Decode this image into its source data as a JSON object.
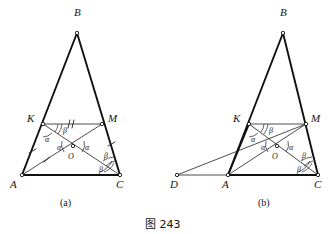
{
  "figure": {
    "caption": "图 243",
    "panels": [
      {
        "id": "a",
        "caption": "(a)",
        "vertex_labels": [
          "B",
          "K",
          "M",
          "A",
          "C",
          "O"
        ],
        "angle_labels": [
          "α",
          "β",
          "α",
          "α",
          "α",
          "β",
          "β"
        ],
        "points": {
          "B": {
            "x": 77,
            "y": 33,
            "label": "B",
            "label_x": 74,
            "label_y": 16
          },
          "K": {
            "x": 43,
            "y": 124,
            "label": "K",
            "label_x": 27,
            "label_y": 122
          },
          "M": {
            "x": 102,
            "y": 124,
            "label": "M",
            "label_x": 108,
            "label_y": 122
          },
          "A": {
            "x": 22,
            "y": 175,
            "label": "A",
            "label_x": 10,
            "label_y": 188
          },
          "C": {
            "x": 120,
            "y": 175,
            "label": "C",
            "label_x": 118,
            "label_y": 188
          },
          "O": {
            "x": 73,
            "y": 146,
            "label": "O",
            "label_x": 68,
            "label_y": 158
          }
        },
        "angles": {
          "alpha_KAO": {
            "text": "α",
            "x": 47,
            "y": 141
          },
          "alpha_AOK": {
            "text": "α",
            "x": 61,
            "y": 147
          },
          "alpha_MOC": {
            "text": "α",
            "x": 86,
            "y": 147
          },
          "beta_KMO": {
            "text": "β",
            "x": 65,
            "y": 130
          },
          "beta_MCO": {
            "text": "β",
            "x": 105,
            "y": 155
          },
          "beta_OCA": {
            "text": "β",
            "x": 101,
            "y": 170
          }
        }
      },
      {
        "id": "b",
        "caption": "(b)",
        "vertex_labels": [
          "B",
          "K",
          "M",
          "D",
          "A",
          "C",
          "O"
        ],
        "angle_labels": [
          "α",
          "β",
          "α",
          "α",
          "β",
          "β"
        ],
        "points": {
          "B": {
            "x": 283,
            "y": 33,
            "label": "B",
            "label_x": 280,
            "label_y": 16
          },
          "K": {
            "x": 249,
            "y": 124,
            "label": "K",
            "label_x": 233,
            "label_y": 122
          },
          "M": {
            "x": 306,
            "y": 124,
            "label": "M",
            "label_x": 312,
            "label_y": 122
          },
          "D": {
            "x": 177,
            "y": 175,
            "label": "D",
            "label_x": 172,
            "label_y": 188
          },
          "A": {
            "x": 228,
            "y": 175,
            "label": "A",
            "label_x": 224,
            "label_y": 188
          },
          "C": {
            "x": 318,
            "y": 175,
            "label": "C",
            "label_x": 316,
            "label_y": 188
          },
          "O": {
            "x": 277,
            "y": 146,
            "label": "O",
            "label_x": 274,
            "label_y": 158
          }
        },
        "angles": {
          "alpha_KAO": {
            "text": "α",
            "x": 252,
            "y": 141
          },
          "alpha_AOK": {
            "text": "α",
            "x": 265,
            "y": 147
          },
          "alpha_MOC": {
            "text": "α",
            "x": 290,
            "y": 147
          },
          "beta_KMO": {
            "text": "β",
            "x": 271,
            "y": 130
          },
          "beta_MCO": {
            "text": "β",
            "x": 303,
            "y": 155
          },
          "beta_OCA": {
            "text": "β",
            "x": 299,
            "y": 170
          }
        }
      }
    ]
  },
  "colors": {
    "ink": "#151515",
    "background": "#ffffff",
    "line": "#1e1e1e"
  }
}
